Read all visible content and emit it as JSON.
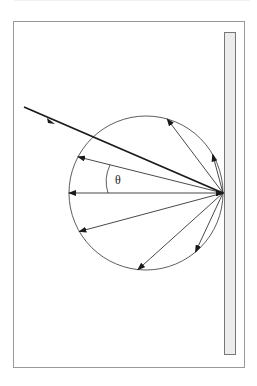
{
  "diagram": {
    "label_angle": "θ",
    "colors": {
      "line": "#1a1a1a",
      "frame": "#999999",
      "plate_fill": "#ececec",
      "plate_stroke": "#777777"
    },
    "circle": {
      "cx": 146,
      "cy": 193,
      "r": 77
    },
    "origin": {
      "x": 223,
      "y": 193
    },
    "reflected_ray_angles_deg": [
      -129,
      -104,
      -75,
      -53,
      -14,
      0,
      15,
      42,
      65,
      90,
      117
    ]
  }
}
